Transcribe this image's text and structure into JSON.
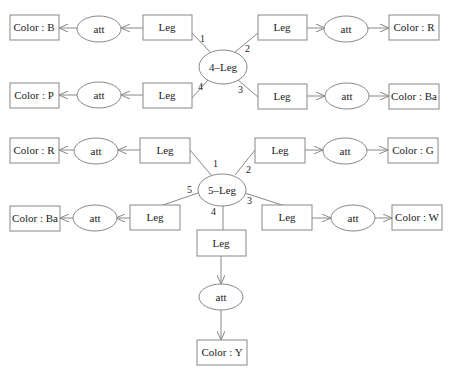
{
  "diagrams": [
    {
      "center": {
        "label": "4–Leg"
      },
      "branches": [
        {
          "port": "1",
          "leg": "Leg",
          "att": "att",
          "color": "Color : B"
        },
        {
          "port": "2",
          "leg": "Leg",
          "att": "att",
          "color": "Color : R"
        },
        {
          "port": "3",
          "leg": "Leg",
          "att": "att",
          "color": "Color : Ba"
        },
        {
          "port": "4",
          "leg": "Leg",
          "att": "att",
          "color": "Color : P"
        }
      ]
    },
    {
      "center": {
        "label": "5–Leg"
      },
      "branches": [
        {
          "port": "1",
          "leg": "Leg",
          "att": "att",
          "color": "Color : R"
        },
        {
          "port": "2",
          "leg": "Leg",
          "att": "att",
          "color": "Color : G"
        },
        {
          "port": "3",
          "leg": "Leg",
          "att": "att",
          "color": "Color : W"
        },
        {
          "port": "4",
          "leg": "Leg",
          "att": "att",
          "color": "Color : Y"
        },
        {
          "port": "5",
          "leg": "Leg",
          "att": "att",
          "color": "Color : Ba"
        }
      ]
    }
  ]
}
